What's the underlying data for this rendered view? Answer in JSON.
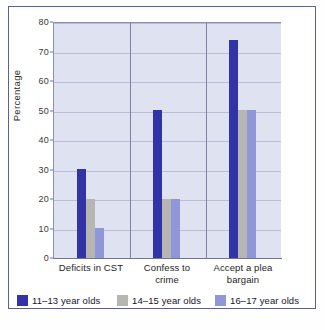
{
  "chart_data": {
    "type": "bar",
    "title": "",
    "subtitle": "",
    "xlabel": "",
    "ylabel": "Percentage",
    "ylim": [
      0,
      80
    ],
    "yticks": [
      0,
      10,
      20,
      30,
      40,
      50,
      60,
      70,
      80
    ],
    "ytick_labels": [
      "0",
      "10",
      "20",
      "30",
      "40",
      "50",
      "60",
      "70",
      "80"
    ],
    "grid": true,
    "legend_position": "bottom",
    "categories": [
      "Deficits in CST",
      "Confess to crime",
      "Accept a plea bargain"
    ],
    "category_lines": [
      [
        "Deficits in CST"
      ],
      [
        "Confess to",
        "crime"
      ],
      [
        "Accept a plea",
        "bargain"
      ]
    ],
    "series": [
      {
        "name": "11–13 year olds",
        "color": "#3333a8",
        "values": [
          30,
          50,
          74
        ]
      },
      {
        "name": "14–15 year olds",
        "color": "#b6b6b2",
        "values": [
          20,
          20,
          50
        ]
      },
      {
        "name": "16–17 year olds",
        "color": "#8f97d8",
        "values": [
          10,
          20,
          50
        ]
      }
    ]
  },
  "figure": {
    "plot_background": "#dfe2f0",
    "frame_color": "#5b5f9b",
    "gridline_color": "#b9bcd4",
    "separator_color": "#7d81a8"
  }
}
